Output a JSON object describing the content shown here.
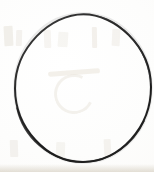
{
  "document": {
    "type": "scanned-figure",
    "title": "Circle outline",
    "description": "A single hand-inked circle outline on blank white paper, scanned.",
    "page_background_color": "#fdfdfc",
    "canvas": {
      "width": 154,
      "height": 172
    }
  },
  "figure": {
    "name": "circle",
    "shape": "circle",
    "filled": false,
    "stroke_color": "#1f1f1f",
    "stroke_color_light": "#3a3a3a",
    "stroke_width_px": 2,
    "fill_color": "none",
    "center_x": 83,
    "center_y": 88,
    "radius_x": 68,
    "radius_y": 74,
    "bounds": {
      "left": 15,
      "top": 14,
      "right": 151,
      "bottom": 162
    },
    "label": ""
  },
  "artifacts": {
    "name": "reverse-side-bleed-through",
    "color": "#d9d2c4",
    "bottom_edge_shadow_color": "#cdc5b5",
    "visible_text": ""
  },
  "annotations": {
    "caption": "",
    "page_number": "",
    "footer": ""
  }
}
